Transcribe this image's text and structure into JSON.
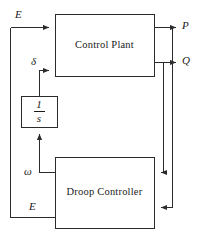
{
  "diagram": {
    "canvas": {
      "width": 203,
      "height": 239
    },
    "stroke_color": "#2b2b2b",
    "text_color": "#1a1a1a",
    "background_color": "#ffffff",
    "blocks": [
      {
        "id": "control-plant",
        "label": "Control Plant",
        "x": 55,
        "y": 14,
        "width": 99,
        "height": 62
      },
      {
        "id": "integrator",
        "label": "1/s",
        "numerator": "1",
        "denominator": "s",
        "x": 21,
        "y": 96,
        "width": 36,
        "height": 31
      },
      {
        "id": "droop-controller",
        "label": "Droop Controller",
        "x": 55,
        "y": 157,
        "width": 99,
        "height": 71
      }
    ],
    "signals": [
      {
        "id": "e-input-top",
        "label": "E",
        "x": 15,
        "y": 8
      },
      {
        "id": "delta",
        "label": "δ",
        "x": 31,
        "y": 55
      },
      {
        "id": "omega",
        "label": "ω",
        "x": 26,
        "y": 166
      },
      {
        "id": "e-input-bottom",
        "label": "E",
        "x": 29,
        "y": 201
      },
      {
        "id": "p-output",
        "label": "P",
        "x": 182,
        "y": 20
      },
      {
        "id": "q-output",
        "label": "Q",
        "x": 182,
        "y": 55
      }
    ],
    "connections": [
      {
        "id": "e-to-plant",
        "from": "e-bus",
        "to": "control-plant",
        "arrow": true
      },
      {
        "id": "integrator-to-plant-delta",
        "from": "integrator",
        "to": "control-plant",
        "arrow": true
      },
      {
        "id": "omega-to-integrator",
        "from": "droop-controller",
        "to": "integrator",
        "arrow": true
      },
      {
        "id": "plant-to-p",
        "from": "control-plant",
        "to": "p-output",
        "arrow": true
      },
      {
        "id": "plant-to-q",
        "from": "control-plant",
        "to": "q-output",
        "arrow": true
      },
      {
        "id": "p-feedback-to-droop",
        "from": "p-output",
        "to": "droop-controller",
        "arrow": true
      },
      {
        "id": "q-feedback-to-droop",
        "from": "q-output",
        "to": "droop-controller",
        "arrow": true
      },
      {
        "id": "e-bus-to-droop",
        "from": "e-bus",
        "to": "droop-controller",
        "arrow": false
      }
    ]
  }
}
